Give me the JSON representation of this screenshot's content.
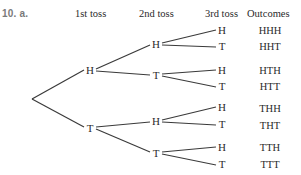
{
  "problem_label": "10. a.",
  "headers": {
    "toss1": "1st toss",
    "toss2": "2nd toss",
    "toss3": "3rd toss",
    "outcomes": "Outcomes"
  },
  "tree": {
    "level1": [
      {
        "label": "H",
        "x": 90,
        "y": 70
      },
      {
        "label": "T",
        "x": 90,
        "y": 128
      }
    ],
    "level2": [
      {
        "label": "H",
        "x": 156,
        "y": 44
      },
      {
        "label": "T",
        "x": 156,
        "y": 75
      },
      {
        "label": "H",
        "x": 156,
        "y": 121
      },
      {
        "label": "T",
        "x": 156,
        "y": 153
      }
    ],
    "level3": [
      {
        "label": "H",
        "x": 222,
        "y": 30
      },
      {
        "label": "T",
        "x": 222,
        "y": 46
      },
      {
        "label": "H",
        "x": 222,
        "y": 70
      },
      {
        "label": "T",
        "x": 222,
        "y": 86
      },
      {
        "label": "H",
        "x": 222,
        "y": 107
      },
      {
        "label": "T",
        "x": 222,
        "y": 124
      },
      {
        "label": "H",
        "x": 222,
        "y": 147
      },
      {
        "label": "T",
        "x": 222,
        "y": 164
      }
    ]
  },
  "outcomes": [
    "HHH",
    "HHT",
    "HTH",
    "HTT",
    "THH",
    "THT",
    "TTH",
    "TTT"
  ]
}
